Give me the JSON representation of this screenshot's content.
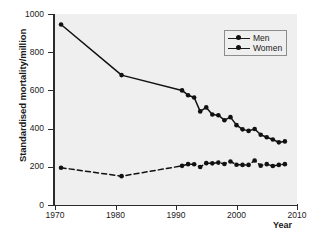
{
  "chart_data": {
    "type": "line",
    "title": "",
    "xlabel": "Year",
    "ylabel": "Standardised mortality/million",
    "xlim": [
      1970,
      2010
    ],
    "ylim": [
      0,
      1000
    ],
    "xticks": [
      1970,
      1980,
      1990,
      2000,
      2010
    ],
    "yticks": [
      0,
      200,
      400,
      600,
      800,
      1000
    ],
    "grid": false,
    "legend_position": "top-right",
    "series": [
      {
        "name": "Men",
        "style": "solid",
        "marker": "circle",
        "color": "#111111",
        "points": [
          [
            1971,
            945
          ],
          [
            1981,
            680
          ],
          [
            1991,
            600
          ],
          [
            1992,
            575
          ],
          [
            1993,
            563
          ],
          [
            1994,
            490
          ],
          [
            1995,
            511
          ],
          [
            1996,
            474
          ],
          [
            1997,
            470
          ],
          [
            1998,
            444
          ],
          [
            1999,
            460
          ],
          [
            2000,
            418
          ],
          [
            2001,
            396
          ],
          [
            2002,
            388
          ],
          [
            2003,
            398
          ],
          [
            2004,
            368
          ],
          [
            2005,
            355
          ],
          [
            2006,
            343
          ],
          [
            2007,
            328
          ],
          [
            2008,
            333
          ]
        ]
      },
      {
        "name": "Women",
        "style": "dashed",
        "marker": "circle",
        "color": "#111111",
        "points": [
          [
            1971,
            195
          ],
          [
            1981,
            151
          ],
          [
            1991,
            205
          ],
          [
            1992,
            214
          ],
          [
            1993,
            213
          ],
          [
            1994,
            199
          ],
          [
            1995,
            219
          ],
          [
            1996,
            218
          ],
          [
            1997,
            222
          ],
          [
            1998,
            215
          ],
          [
            1999,
            228
          ],
          [
            2000,
            211
          ],
          [
            2001,
            210
          ],
          [
            2002,
            210
          ],
          [
            2003,
            233
          ],
          [
            2004,
            206
          ],
          [
            2005,
            214
          ],
          [
            2006,
            204
          ],
          [
            2007,
            210
          ],
          [
            2008,
            214
          ]
        ]
      }
    ]
  },
  "legend": {
    "items": [
      {
        "label": "Men"
      },
      {
        "label": "Women"
      }
    ]
  },
  "caption": {
    "text": ""
  }
}
